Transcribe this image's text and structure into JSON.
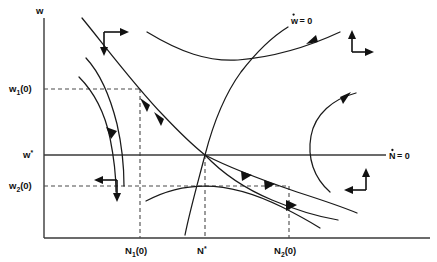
{
  "figure": {
    "type": "phase-plane-diagram",
    "background_color": "#ffffff",
    "line_color": "#1a1a1a",
    "dash_color": "#4a4a4a"
  },
  "axes": {
    "y_axis_label": "w",
    "x_axis_label": "",
    "y_axis_x": 44,
    "x_axis_y": 238,
    "y_axis_top": 18,
    "x_axis_right": 430
  },
  "nullclines": [
    {
      "name": "w-dot-nullcline",
      "label": "w",
      "label_dot": "˙",
      "label_eq": "= 0",
      "label_full": "ẇ = 0",
      "label_x": 288,
      "label_y": 22,
      "description": "steep rising S-shaped curve through the steady state"
    },
    {
      "name": "N-dot-nullcline",
      "label": "N",
      "label_dot": "˙",
      "label_eq": "= 0",
      "label_full": "Ṅ = 0",
      "label_x": 398,
      "label_y": 158,
      "description": "horizontal line at w*"
    }
  ],
  "tick_labels": {
    "y": [
      {
        "name": "w1-zero",
        "base": "w",
        "sub": "1",
        "suffix": "(0)",
        "full": "w₁(0)",
        "value_y": 89,
        "x": 8
      },
      {
        "name": "w-star",
        "base": "w",
        "sub": "",
        "suffix": "*",
        "full": "w*",
        "value_y": 155,
        "x": 22
      },
      {
        "name": "w2-zero",
        "base": "w",
        "sub": "2",
        "suffix": "(0)",
        "full": "w₂(0)",
        "value_y": 186,
        "x": 8
      }
    ],
    "x": [
      {
        "name": "N1-zero",
        "base": "N",
        "sub": "1",
        "suffix": "(0)",
        "full": "N₁(0)",
        "value_x": 139,
        "y": 252
      },
      {
        "name": "N-star",
        "base": "N",
        "sub": "",
        "suffix": "*",
        "full": "N*",
        "value_x": 205,
        "y": 252
      },
      {
        "name": "N2-zero",
        "base": "N",
        "sub": "2",
        "suffix": "(0)",
        "full": "N₂(0)",
        "value_x": 288,
        "y": 252
      }
    ]
  },
  "steady_state": {
    "name": "saddle-point",
    "x": 205,
    "y": 155,
    "label": "N*, w*"
  },
  "guide_lines": [
    {
      "name": "w1-guide",
      "orientation": "horizontal",
      "from_x": 44,
      "to_x": 140,
      "y": 89
    },
    {
      "name": "w2-guide",
      "orientation": "horizontal",
      "from_x": 44,
      "to_x": 289,
      "y": 186
    },
    {
      "name": "N1-guide",
      "orientation": "vertical",
      "x": 140,
      "from_y": 89,
      "to_y": 238
    },
    {
      "name": "Nstar-guide",
      "orientation": "vertical",
      "x": 205,
      "from_y": 155,
      "to_y": 238
    },
    {
      "name": "N2-guide",
      "orientation": "vertical",
      "x": 289,
      "from_y": 186,
      "to_y": 238
    }
  ],
  "direction_field": [
    {
      "name": "quadrant-upper-left",
      "horizontal": "right",
      "vertical": "down",
      "corner_x": 104,
      "corner_y": 32
    },
    {
      "name": "quadrant-upper-right",
      "horizontal": "right",
      "vertical": "up",
      "corner_x": 352,
      "corner_y": 52
    },
    {
      "name": "quadrant-lower-left",
      "horizontal": "left",
      "vertical": "down",
      "corner_x": 117,
      "corner_y": 180
    },
    {
      "name": "quadrant-lower-right",
      "horizontal": "left",
      "vertical": "up",
      "corner_x": 366,
      "corner_y": 190
    }
  ],
  "trajectories": [
    {
      "name": "stable-manifold-upper",
      "arrows": 2,
      "direction": "toward-steady-state"
    },
    {
      "name": "stable-manifold-lower",
      "arrows": 2,
      "direction": "toward-steady-state"
    },
    {
      "name": "divergent-upper-left",
      "arrows": 1,
      "direction": "down-left"
    },
    {
      "name": "divergent-upper-left-outer",
      "arrows": 0,
      "direction": "down-left"
    },
    {
      "name": "divergent-upper-right",
      "arrows": 1,
      "direction": "up-right"
    },
    {
      "name": "divergent-right-outer",
      "arrows": 1,
      "direction": "up-right"
    },
    {
      "name": "divergent-lower-hump",
      "arrows": 0,
      "direction": "right-down"
    },
    {
      "name": "divergent-lower-right",
      "arrows": 1,
      "direction": "down-right"
    }
  ]
}
